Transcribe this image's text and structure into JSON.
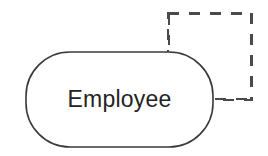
{
  "diagram": {
    "type": "entity-relationship-fragment",
    "background_color": "#ffffff",
    "canvas": {
      "width": 268,
      "height": 156
    },
    "nodes": [
      {
        "id": "employee-entity",
        "shape": "rounded-rectangle",
        "label": "Employee",
        "stroke_color": "#3a3a3a",
        "stroke_width": 1.6,
        "stroke_style": "solid",
        "fill": "none",
        "x": 26,
        "y": 52,
        "width": 187,
        "height": 95,
        "corner_radius": 44
      },
      {
        "id": "dashed-rectangle",
        "shape": "rectangle",
        "label": "",
        "stroke_color": "#4a4a4a",
        "stroke_width": 2,
        "stroke_style": "dashed",
        "dash_pattern": "11 10",
        "fill": "none",
        "x": 168,
        "y": 13,
        "width": 84,
        "height": 87
      }
    ]
  }
}
